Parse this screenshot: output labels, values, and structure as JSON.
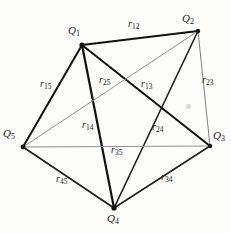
{
  "figure": {
    "width": 231,
    "height": 233,
    "background": "#fdfdfc",
    "ink_dark": "#111111",
    "ink_gray": "#8d8d8d"
  },
  "vertices": [
    {
      "id": "Q1",
      "base": "Q",
      "sub": "1",
      "x": 82,
      "y": 45,
      "label_x": 68,
      "label_y": 25,
      "dot": 2.6
    },
    {
      "id": "Q2",
      "base": "Q",
      "sub": "2",
      "x": 198,
      "y": 31,
      "label_x": 182,
      "label_y": 13,
      "dot": 2.2
    },
    {
      "id": "Q3",
      "base": "Q",
      "sub": "3",
      "x": 210,
      "y": 146,
      "label_x": 213,
      "label_y": 130,
      "dot": 2.2
    },
    {
      "id": "Q4",
      "base": "Q",
      "sub": "4",
      "x": 114,
      "y": 208,
      "label_x": 107,
      "label_y": 213,
      "dot": 2.6
    },
    {
      "id": "Q5",
      "base": "Q",
      "sub": "5",
      "x": 23,
      "y": 147,
      "label_x": 3,
      "label_y": 128,
      "dot": 2.4
    }
  ],
  "edges": [
    {
      "id": "r12",
      "base": "r",
      "sub": "12",
      "from": "Q1",
      "to": "Q2",
      "weight": "bold",
      "color": "#111111",
      "stroke": 2.1,
      "label_x": 128,
      "label_y": 19
    },
    {
      "id": "r13",
      "base": "r",
      "sub": "13",
      "from": "Q1",
      "to": "Q3",
      "weight": "bold",
      "color": "#111111",
      "stroke": 2.0,
      "label_x": 141,
      "label_y": 79
    },
    {
      "id": "r14",
      "base": "r",
      "sub": "14",
      "from": "Q1",
      "to": "Q4",
      "weight": "bold",
      "color": "#111111",
      "stroke": 2.2,
      "label_x": 82,
      "label_y": 120
    },
    {
      "id": "r15",
      "base": "r",
      "sub": "15",
      "from": "Q1",
      "to": "Q5",
      "weight": "bold",
      "color": "#111111",
      "stroke": 2.0,
      "label_x": 40,
      "label_y": 79
    },
    {
      "id": "r23",
      "base": "r",
      "sub": "23",
      "from": "Q2",
      "to": "Q3",
      "weight": "thin",
      "color": "#7f7f7f",
      "stroke": 1.0,
      "label_x": 202,
      "label_y": 75
    },
    {
      "id": "r24",
      "base": "r",
      "sub": "24",
      "from": "Q2",
      "to": "Q4",
      "weight": "bold",
      "color": "#1d1d1d",
      "stroke": 1.6,
      "label_x": 152,
      "label_y": 122
    },
    {
      "id": "r25",
      "base": "r",
      "sub": "25",
      "from": "Q2",
      "to": "Q5",
      "weight": "thin",
      "color": "#8f8f8f",
      "stroke": 1.0,
      "label_x": 99,
      "label_y": 75
    },
    {
      "id": "r34",
      "base": "r",
      "sub": "34",
      "from": "Q3",
      "to": "Q4",
      "weight": "bold",
      "color": "#1d1d1d",
      "stroke": 1.5,
      "label_x": 161,
      "label_y": 172
    },
    {
      "id": "r35",
      "base": "r",
      "sub": "35",
      "from": "Q3",
      "to": "Q5",
      "weight": "thin",
      "color": "#8f8f8f",
      "stroke": 1.1,
      "label_x": 111,
      "label_y": 145
    },
    {
      "id": "r45",
      "base": "r",
      "sub": "45",
      "from": "Q4",
      "to": "Q5",
      "weight": "bold",
      "color": "#1d1d1d",
      "stroke": 1.6,
      "label_x": 56,
      "label_y": 174
    }
  ],
  "marks": [
    {
      "id": "smudge",
      "x": 186,
      "y": 104,
      "size": 5
    }
  ]
}
